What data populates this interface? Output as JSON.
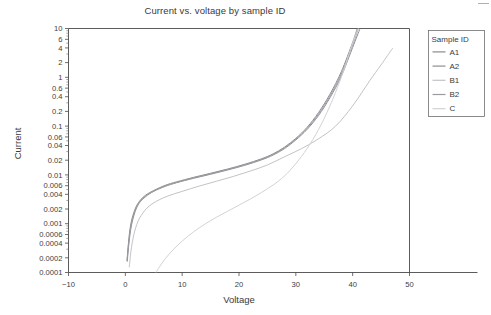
{
  "chart_data": {
    "type": "line",
    "title": "Current vs. voltage by sample ID",
    "xlabel": "Voltage",
    "ylabel": "Current",
    "xlim": [
      -10,
      50
    ],
    "ylim": [
      0.0001,
      10
    ],
    "yscale": "log",
    "xscale": "linear",
    "grid": false,
    "legend_position": "right",
    "legend_title": "Sample ID",
    "xticks": [
      -10,
      0,
      10,
      20,
      30,
      40,
      50
    ],
    "xticklabels": [
      "−10",
      "0",
      "10",
      "20",
      "30",
      "40",
      "50"
    ],
    "yticks": [
      0.0001,
      0.0002,
      0.0004,
      0.0006,
      0.001,
      0.002,
      0.004,
      0.006,
      0.01,
      0.02,
      0.04,
      0.06,
      0.1,
      0.2,
      0.4,
      0.6,
      1,
      2,
      4,
      6,
      10
    ],
    "yticklabels": [
      "0.0001",
      "0.0002",
      "0.0004",
      "0.0006",
      "0.001",
      "0.002",
      "0.004",
      "0.006",
      "0.01",
      "0.02",
      "0.04",
      "0.06",
      "0.1",
      "0.2",
      "0.4",
      "0.6",
      "1",
      "2",
      "4",
      "6",
      "10"
    ],
    "series": [
      {
        "name": "A1",
        "color": "#8a8a92",
        "x": [
          0.3,
          0.5,
          0.8,
          1.2,
          1.8,
          2.5,
          3.5,
          5,
          7,
          9,
          12,
          15,
          18,
          21,
          24,
          26,
          28,
          30,
          32,
          34,
          36,
          38,
          40,
          40.8
        ],
        "y": [
          0.00018,
          0.00035,
          0.00075,
          0.0013,
          0.0021,
          0.0029,
          0.0038,
          0.0048,
          0.0061,
          0.0072,
          0.0089,
          0.0108,
          0.0132,
          0.0165,
          0.0215,
          0.027,
          0.037,
          0.056,
          0.095,
          0.19,
          0.45,
          1.3,
          5.2,
          10
        ]
      },
      {
        "name": "A2",
        "color": "#8f8f96",
        "x": [
          0.35,
          0.55,
          0.9,
          1.3,
          1.9,
          2.6,
          3.6,
          5,
          7,
          9,
          12,
          15,
          18,
          21,
          24,
          26,
          28,
          30,
          32,
          34,
          36,
          38,
          40,
          41.3
        ],
        "y": [
          0.00017,
          0.00032,
          0.0007,
          0.0012,
          0.002,
          0.0028,
          0.0036,
          0.0046,
          0.0058,
          0.0069,
          0.0085,
          0.0103,
          0.0126,
          0.0157,
          0.0204,
          0.0255,
          0.0345,
          0.052,
          0.086,
          0.165,
          0.38,
          1.05,
          4.1,
          10
        ]
      },
      {
        "name": "B1",
        "color": "#c3c3c8",
        "x": [
          0.7,
          1.0,
          1.5,
          2.2,
          3.0,
          4.0,
          5.5,
          7.5,
          10,
          13,
          16,
          19,
          22,
          25,
          28,
          31,
          34,
          37,
          40,
          43,
          45,
          47
        ],
        "y": [
          0.00013,
          0.00028,
          0.0006,
          0.0011,
          0.0016,
          0.0022,
          0.0029,
          0.0037,
          0.0046,
          0.0059,
          0.0074,
          0.0093,
          0.012,
          0.016,
          0.0235,
          0.0345,
          0.055,
          0.1,
          0.26,
          0.85,
          1.8,
          3.9
        ]
      },
      {
        "name": "B2",
        "color": "#9a9aa0",
        "x": [
          0.32,
          0.52,
          0.85,
          1.25,
          1.85,
          2.55,
          3.55,
          5,
          7,
          9,
          12,
          15,
          18,
          21,
          24,
          26,
          28,
          30,
          32,
          34,
          36,
          38,
          40,
          41.0
        ],
        "y": [
          0.000175,
          0.00033,
          0.00072,
          0.00125,
          0.00205,
          0.00285,
          0.0037,
          0.0047,
          0.006,
          0.007,
          0.0087,
          0.0105,
          0.0129,
          0.0161,
          0.0209,
          0.0262,
          0.0357,
          0.054,
          0.09,
          0.177,
          0.41,
          1.17,
          4.6,
          10
        ]
      },
      {
        "name": "C",
        "color": "#d2d2d6",
        "x": [
          5.4,
          6,
          7,
          8.5,
          10,
          12,
          14,
          16,
          18,
          20,
          22,
          24,
          26,
          28,
          30,
          32,
          34,
          36,
          38,
          40,
          41
        ],
        "y": [
          0.0001,
          0.00013,
          0.00019,
          0.0003,
          0.00044,
          0.00068,
          0.00098,
          0.00135,
          0.0018,
          0.0024,
          0.0032,
          0.0044,
          0.0062,
          0.0095,
          0.017,
          0.035,
          0.085,
          0.26,
          1.0,
          5.0,
          10
        ]
      }
    ]
  },
  "legend": {
    "title": "Sample ID",
    "entries": [
      {
        "label": "A1",
        "color": "#8a8a92"
      },
      {
        "label": "A2",
        "color": "#8f8f96"
      },
      {
        "label": "B1",
        "color": "#c3c3c8"
      },
      {
        "label": "B2",
        "color": "#9a9aa0"
      },
      {
        "label": "C",
        "color": "#d2d2d6"
      }
    ]
  },
  "colors": {
    "background": "#ffffff",
    "axis": "#4a4a4a",
    "text": "#3c3c3c",
    "legend_border": "#6e6e6e"
  }
}
